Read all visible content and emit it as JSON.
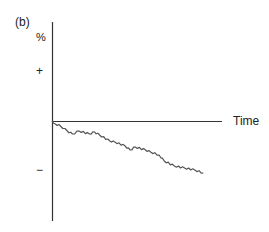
{
  "panel_label": "(b)",
  "axes": {
    "ylabel": "%",
    "xlabel": "Time",
    "ytick_plus": "+",
    "ytick_minus": "−"
  },
  "colors": {
    "axis": "#333333",
    "series": "#555555",
    "background": "#ffffff"
  },
  "chart_data": {
    "type": "line",
    "title": "(b)",
    "xlabel": "Time",
    "ylabel": "%",
    "ytick_labels": [
      "+",
      "0",
      "−"
    ],
    "ylim": [
      -2,
      2
    ],
    "xlim": [
      0,
      1
    ],
    "grid": false,
    "legend": null,
    "series": [
      {
        "name": "percent change",
        "x": [
          0.0,
          0.02,
          0.05,
          0.09,
          0.12,
          0.16,
          0.22,
          0.25,
          0.28,
          0.34,
          0.37,
          0.43,
          0.46,
          0.49,
          0.55,
          0.58,
          0.63,
          0.66,
          0.72,
          0.78,
          0.84,
          0.89
        ],
        "values": [
          0.0,
          -0.06,
          -0.1,
          -0.2,
          -0.26,
          -0.2,
          -0.26,
          -0.22,
          -0.28,
          -0.4,
          -0.42,
          -0.5,
          -0.58,
          -0.52,
          -0.58,
          -0.62,
          -0.68,
          -0.8,
          -0.9,
          -0.94,
          -0.98,
          -1.04
        ]
      }
    ]
  }
}
